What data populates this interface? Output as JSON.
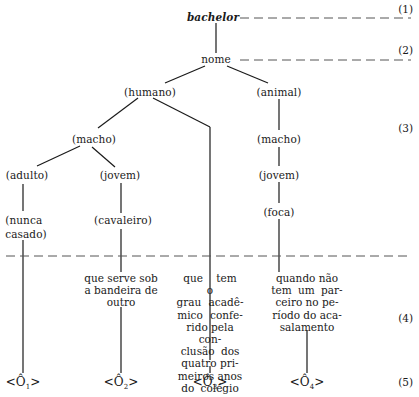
{
  "diagram": {
    "root": "bachelor",
    "grammatical_marker": "nome",
    "nodes": {
      "humano": "(humano)",
      "animal": "(animal)",
      "macho_left": "(macho)",
      "macho_right": "(macho)",
      "adulto": "(adulto)",
      "jovem_left": "(jovem)",
      "jovem_right": "(jovem)",
      "nunca_casado_line1": "(nunca",
      "nunca_casado_line2": "casado)",
      "cavaleiro": "(cavaleiro)",
      "foca": "(foca)"
    },
    "distinguishers": {
      "d1": [
        "que serve sob",
        "a bandeira de",
        "outro"
      ],
      "d2": [
        "que tem o",
        "grau acadê-",
        "mico confe-",
        "rido pela con-",
        "clusão dos",
        "quatro pri-",
        "meiros anos",
        "do colégio"
      ],
      "d3": [
        "quando não",
        "tem um par-",
        "ceiro no pe-",
        "ríodo do aca-",
        "salamento"
      ]
    },
    "selection_restrictions": [
      {
        "base": "<Ô",
        "sub": "1",
        "close": ">"
      },
      {
        "base": "<Ô",
        "sub": "2",
        "close": ">"
      },
      {
        "base": "<Ô",
        "sub": "3",
        "close": ">"
      },
      {
        "base": "<Ô",
        "sub": "4",
        "close": ">"
      }
    ],
    "level_labels": [
      "(1)",
      "(2)",
      "(3)",
      "(4)",
      "(5)"
    ],
    "colors": {
      "ink": "#1a1a1a",
      "dash": "#555555",
      "background": "#ffffff"
    }
  }
}
